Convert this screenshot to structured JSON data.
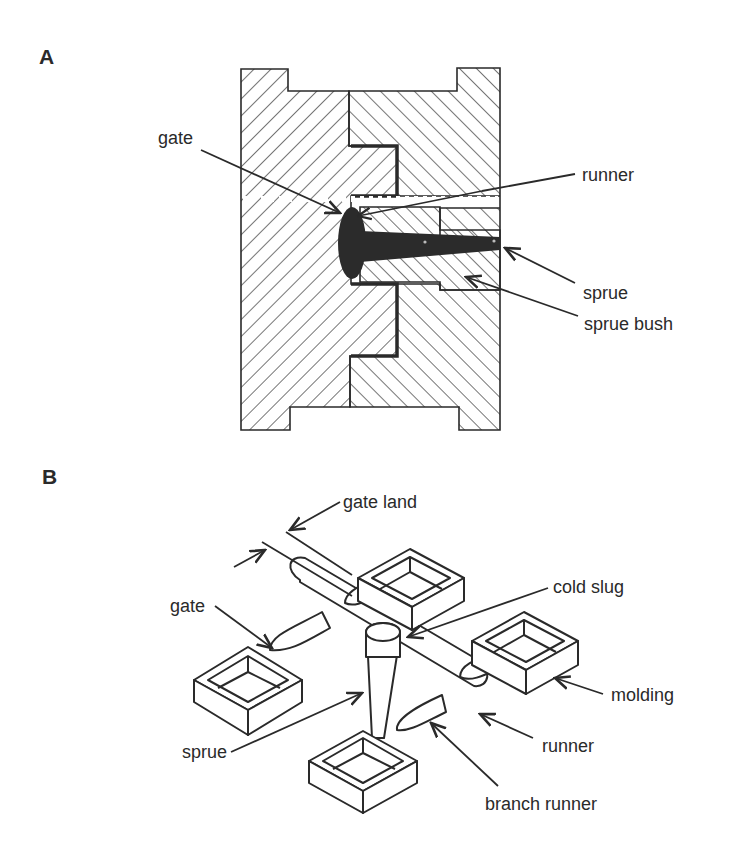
{
  "figure": {
    "panels": [
      {
        "id": "A",
        "label": "A",
        "title": "Mold cross-section",
        "callouts": [
          {
            "text": "gate"
          },
          {
            "text": "runner"
          },
          {
            "text": "sprue"
          },
          {
            "text": "sprue bush"
          }
        ]
      },
      {
        "id": "B",
        "label": "B",
        "title": "Isometric shot with four moldings",
        "callouts": [
          {
            "text": "gate land"
          },
          {
            "text": "gate"
          },
          {
            "text": "cold slug"
          },
          {
            "text": "molding"
          },
          {
            "text": "sprue"
          },
          {
            "text": "runner"
          },
          {
            "text": "branch runner"
          }
        ]
      }
    ],
    "colors": {
      "ink": "#2a2a2a",
      "background": "#ffffff",
      "melt": "#2b2b2b"
    }
  }
}
